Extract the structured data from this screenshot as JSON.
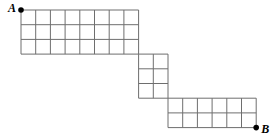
{
  "diagram": {
    "type": "grid-path",
    "line_color": "#6e6e6e",
    "point_color": "#000000",
    "cell_size": 14.7,
    "blocks": [
      {
        "name": "top",
        "x": 21,
        "y": 10,
        "cols": 8,
        "rows": 3
      },
      {
        "name": "middle",
        "x": 138.6,
        "y": 54.1,
        "cols": 2,
        "rows": 3
      },
      {
        "name": "bottom",
        "x": 168,
        "y": 98.2,
        "cols": 6,
        "rows": 2
      }
    ],
    "points": [
      {
        "label": "A",
        "x": 21,
        "y": 10
      },
      {
        "label": "B",
        "x": 256.2,
        "y": 127.6
      }
    ]
  }
}
